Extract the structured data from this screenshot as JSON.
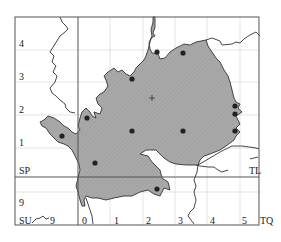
{
  "map": {
    "colors": {
      "fill": "#a9a9a9",
      "outline": "#333333",
      "frame": "#555555",
      "grid": "#d8d8d8",
      "dot": "#222222",
      "background": "#ffffff"
    },
    "square_labels": {
      "SP": "SP",
      "TL": "TL",
      "SU": "SU",
      "TQ": "TQ"
    },
    "y_axis_labels": [
      "4",
      "3",
      "2",
      "1",
      "9"
    ],
    "x_axis_labels": [
      "9",
      "0",
      "1",
      "2",
      "3",
      "4",
      "5"
    ],
    "records": {
      "dots": [
        {
          "x": 157,
          "y": 52
        },
        {
          "x": 183,
          "y": 53
        },
        {
          "x": 132,
          "y": 79
        },
        {
          "x": 87,
          "y": 118
        },
        {
          "x": 62,
          "y": 136
        },
        {
          "x": 132,
          "y": 131
        },
        {
          "x": 183,
          "y": 131
        },
        {
          "x": 95,
          "y": 163
        },
        {
          "x": 157,
          "y": 189
        },
        {
          "x": 235,
          "y": 106
        },
        {
          "x": 235,
          "y": 114
        },
        {
          "x": 235,
          "y": 131
        }
      ],
      "cross": {
        "x": 152,
        "y": 98
      }
    }
  }
}
